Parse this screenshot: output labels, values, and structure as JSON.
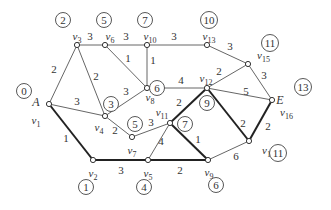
{
  "diagram": {
    "type": "weighted-graph-shortest-path",
    "nodes": [
      {
        "id": "v1",
        "name": "v",
        "sub": "1",
        "alias": "A",
        "x": 49,
        "y": 104,
        "dist": "0"
      },
      {
        "id": "v2",
        "name": "v",
        "sub": "2",
        "x": 93,
        "y": 160,
        "dist": "1"
      },
      {
        "id": "v3",
        "name": "v",
        "sub": "3",
        "x": 77,
        "y": 45,
        "dist": "2"
      },
      {
        "id": "v4",
        "name": "v",
        "sub": "4",
        "x": 105,
        "y": 116,
        "dist": "3"
      },
      {
        "id": "v5",
        "name": "v",
        "sub": "5",
        "x": 148,
        "y": 160,
        "dist": "4"
      },
      {
        "id": "v6",
        "name": "v",
        "sub": "6",
        "x": 105,
        "y": 45,
        "dist": "5"
      },
      {
        "id": "v7",
        "name": "v",
        "sub": "7",
        "x": 132,
        "y": 137,
        "dist": "5"
      },
      {
        "id": "v8",
        "name": "v",
        "sub": "8",
        "x": 147,
        "y": 88,
        "dist": "6"
      },
      {
        "id": "v9",
        "name": "v",
        "sub": "9",
        "x": 208,
        "y": 160,
        "dist": "6"
      },
      {
        "id": "v10",
        "name": "v",
        "sub": "10",
        "x": 147,
        "y": 45,
        "dist": "7"
      },
      {
        "id": "v11",
        "name": "v",
        "sub": "11",
        "x": 170,
        "y": 123,
        "dist": "7"
      },
      {
        "id": "v12",
        "name": "v",
        "sub": "12",
        "x": 207,
        "y": 88,
        "dist": "9"
      },
      {
        "id": "v13",
        "name": "v",
        "sub": "13",
        "x": 207,
        "y": 45,
        "dist": "10"
      },
      {
        "id": "v14",
        "name": "v",
        "sub": "14",
        "x": 249,
        "y": 141,
        "dist": "11"
      },
      {
        "id": "v15",
        "name": "v",
        "sub": "15",
        "x": 248,
        "y": 64,
        "dist": "11"
      },
      {
        "id": "v16",
        "name": "v",
        "sub": "16",
        "alias": "E",
        "x": 272,
        "y": 100,
        "dist": "13"
      }
    ],
    "edges": [
      {
        "from": "v1",
        "to": "v3",
        "w": "2",
        "bold": false,
        "lx": 54,
        "ly": 73
      },
      {
        "from": "v1",
        "to": "v4",
        "w": "3",
        "bold": false,
        "lx": 77,
        "ly": 105
      },
      {
        "from": "v1",
        "to": "v2",
        "w": "1",
        "bold": true,
        "lx": 66,
        "ly": 142
      },
      {
        "from": "v3",
        "to": "v6",
        "w": "3",
        "bold": false,
        "lx": 90,
        "ly": 40
      },
      {
        "from": "v3",
        "to": "v4",
        "w": "2",
        "bold": false,
        "lx": 96,
        "ly": 80
      },
      {
        "from": "v6",
        "to": "v10",
        "w": "3",
        "bold": false,
        "lx": 126,
        "ly": 40
      },
      {
        "from": "v6",
        "to": "v8",
        "w": "1",
        "bold": false,
        "lx": 128,
        "ly": 62
      },
      {
        "from": "v10",
        "to": "v8",
        "w": "1",
        "bold": false,
        "lx": 153,
        "ly": 64
      },
      {
        "from": "v10",
        "to": "v13",
        "w": "3",
        "bold": false,
        "lx": 174,
        "ly": 40
      },
      {
        "from": "v4",
        "to": "v8",
        "w": "3",
        "bold": false,
        "lx": 126,
        "ly": 95
      },
      {
        "from": "v4",
        "to": "v7",
        "w": "2",
        "bold": false,
        "lx": 115,
        "ly": 134
      },
      {
        "from": "v7",
        "to": "v11",
        "w": "3",
        "bold": false,
        "lx": 151,
        "ly": 126
      },
      {
        "from": "v8",
        "to": "v12",
        "w": "4",
        "bold": false,
        "lx": 181,
        "ly": 84
      },
      {
        "from": "v13",
        "to": "v15",
        "w": "3",
        "bold": false,
        "lx": 230,
        "ly": 50
      },
      {
        "from": "v12",
        "to": "v15",
        "w": "2",
        "bold": false,
        "lx": 219,
        "ly": 75
      },
      {
        "from": "v15",
        "to": "v16",
        "w": "3",
        "bold": false,
        "lx": 264,
        "ly": 79
      },
      {
        "from": "v12",
        "to": "v16",
        "w": "5",
        "bold": false,
        "lx": 246,
        "ly": 95
      },
      {
        "from": "v11",
        "to": "v12",
        "w": "2",
        "bold": true,
        "lx": 179,
        "ly": 106
      },
      {
        "from": "v11",
        "to": "v5",
        "w": "4",
        "bold": false,
        "lx": 161,
        "ly": 145
      },
      {
        "from": "v11",
        "to": "v9",
        "w": "1",
        "bold": true,
        "lx": 198,
        "ly": 143
      },
      {
        "from": "v2",
        "to": "v5",
        "w": "3",
        "bold": true,
        "lx": 121,
        "ly": 174
      },
      {
        "from": "v5",
        "to": "v9",
        "w": "2",
        "bold": true,
        "lx": 180,
        "ly": 174
      },
      {
        "from": "v9",
        "to": "v14",
        "w": "6",
        "bold": false,
        "lx": 236,
        "ly": 160
      },
      {
        "from": "v12",
        "to": "v14",
        "w": "2",
        "bold": true,
        "lx": 243,
        "ly": 127
      },
      {
        "from": "v14",
        "to": "v16",
        "w": "2",
        "bold": true,
        "lx": 268,
        "ly": 130
      }
    ],
    "dist_circles": [
      {
        "node": "v1",
        "label": "0",
        "x": 24,
        "y": 91
      },
      {
        "node": "v2",
        "label": "1",
        "x": 86,
        "y": 187
      },
      {
        "node": "v3",
        "label": "2",
        "x": 63,
        "y": 20
      },
      {
        "node": "v4",
        "label": "3",
        "x": 111,
        "y": 104
      },
      {
        "node": "v5",
        "label": "4",
        "x": 144,
        "y": 187
      },
      {
        "node": "v6",
        "label": "5",
        "x": 104,
        "y": 20
      },
      {
        "node": "v7",
        "label": "5",
        "x": 135,
        "y": 124
      },
      {
        "node": "v8",
        "label": "6",
        "x": 157,
        "y": 88
      },
      {
        "node": "v9",
        "label": "6",
        "x": 216,
        "y": 185
      },
      {
        "node": "v10",
        "label": "7",
        "x": 145,
        "y": 20
      },
      {
        "node": "v11",
        "label": "7",
        "x": 185,
        "y": 124
      },
      {
        "node": "v12",
        "label": "9",
        "x": 207,
        "y": 103
      },
      {
        "node": "v13",
        "label": "10",
        "x": 209,
        "y": 20
      },
      {
        "node": "v14",
        "label": "11",
        "x": 278,
        "y": 153
      },
      {
        "node": "v15",
        "label": "11",
        "x": 270,
        "y": 43
      },
      {
        "node": "v16",
        "label": "13",
        "x": 303,
        "y": 87
      }
    ],
    "shortest_path": [
      "v1",
      "v2",
      "v5",
      "v9",
      "v11",
      "v12",
      "v14",
      "v16"
    ],
    "colors": {
      "line": "#555555",
      "bold_line": "#222222",
      "text": "#333333"
    }
  }
}
